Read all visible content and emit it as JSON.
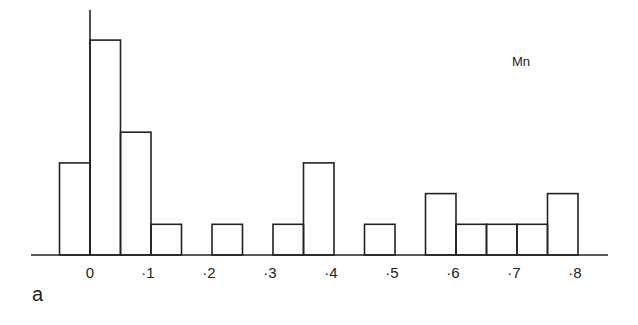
{
  "chart_data": {
    "type": "bar",
    "subtype": "histogram",
    "title": "",
    "series_label": "Mn",
    "panel_label": "a",
    "xlabel": "",
    "ylabel": "",
    "bin_width": 0.05,
    "bins": [
      {
        "start": -0.05,
        "end": 0.0,
        "count": 3
      },
      {
        "start": 0.0,
        "end": 0.05,
        "count": 7
      },
      {
        "start": 0.05,
        "end": 0.1,
        "count": 4
      },
      {
        "start": 0.1,
        "end": 0.15,
        "count": 1
      },
      {
        "start": 0.15,
        "end": 0.2,
        "count": 0
      },
      {
        "start": 0.2,
        "end": 0.25,
        "count": 1
      },
      {
        "start": 0.25,
        "end": 0.3,
        "count": 0
      },
      {
        "start": 0.3,
        "end": 0.35,
        "count": 1
      },
      {
        "start": 0.35,
        "end": 0.4,
        "count": 3
      },
      {
        "start": 0.4,
        "end": 0.45,
        "count": 0
      },
      {
        "start": 0.45,
        "end": 0.5,
        "count": 1
      },
      {
        "start": 0.5,
        "end": 0.55,
        "count": 0
      },
      {
        "start": 0.55,
        "end": 0.6,
        "count": 2
      },
      {
        "start": 0.6,
        "end": 0.65,
        "count": 1
      },
      {
        "start": 0.65,
        "end": 0.7,
        "count": 1
      },
      {
        "start": 0.7,
        "end": 0.75,
        "count": 1
      },
      {
        "start": 0.75,
        "end": 0.8,
        "count": 2
      }
    ],
    "x_tick_labels": [
      "0",
      "·1",
      "·2",
      "·3",
      "·4",
      "·5",
      "·6",
      "·7",
      "·8"
    ],
    "x_tick_values": [
      0,
      0.1,
      0.2,
      0.3,
      0.4,
      0.5,
      0.6,
      0.7,
      0.8
    ],
    "xlim": [
      -0.1,
      0.85
    ],
    "ylim": [
      0,
      7.8
    ],
    "grid": false,
    "legend": "none"
  },
  "colors": {
    "line": "#222222",
    "background": "#ffffff"
  }
}
